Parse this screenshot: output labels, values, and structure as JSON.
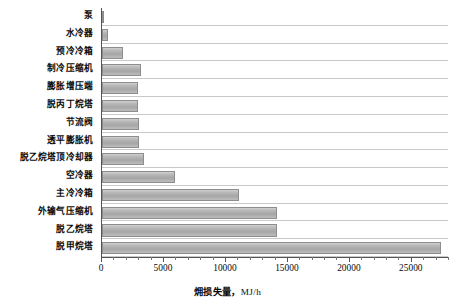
{
  "chart_data": {
    "type": "bar",
    "orientation": "horizontal",
    "title": "",
    "xlabel": "㶲损失量，MJ/h",
    "ylabel": "",
    "xlim": [
      0,
      28000
    ],
    "grid": true,
    "legend": "none",
    "xticks": [
      0,
      5000,
      10000,
      15000,
      20000,
      25000
    ],
    "xtick_labels": [
      "0",
      "5000",
      "10000",
      "15000",
      "20000",
      "25000"
    ],
    "minor_tick_step": 1000,
    "categories": [
      "泵",
      "水冷器",
      "预冷冷箱",
      "制冷压缩机",
      "膨胀增压端",
      "脱丙丁烷塔",
      "节流阀",
      "透平膨胀机",
      "脱乙烷塔顶冷却器",
      "空冷器",
      "主冷冷箱",
      "外输气压缩机",
      "脱乙烷塔",
      "脱甲烷塔"
    ],
    "values": [
      120,
      520,
      1700,
      3150,
      2900,
      2900,
      2950,
      2950,
      3400,
      5900,
      11050,
      14150,
      14150,
      27350
    ],
    "bar_color": "#b4b4b4",
    "bar_edge_color": "#8d8d8d",
    "gridline_color": "#c9c9c9",
    "axis_color": "#555555"
  },
  "axis": {
    "title_main": "㶲损失量",
    "title_sep": "，",
    "title_unit": "MJ/h"
  }
}
